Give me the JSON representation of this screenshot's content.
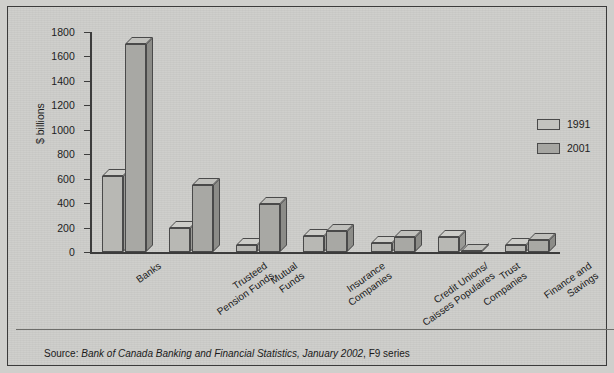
{
  "chart_data": {
    "type": "bar",
    "title": "",
    "subtitle": "",
    "xlabel": "",
    "ylabel": "$ billions",
    "ylim": [
      0,
      1800
    ],
    "ytick_step": 200,
    "yticks": [
      1800,
      1600,
      1400,
      1200,
      1000,
      800,
      600,
      400,
      200,
      0
    ],
    "grid": false,
    "legend_position": "right",
    "categories": [
      "Banks",
      "Trusteed\nPension Funds",
      "Mutual\nFunds",
      "Insurance\nCompanies",
      "Credit Unions/\nCaisses Populaires",
      "Trust\nCompanies",
      "Finance and\nSavings"
    ],
    "series": [
      {
        "name": "1991",
        "color": "#b8b8b4",
        "values": [
          620,
          200,
          60,
          130,
          70,
          125,
          55
        ]
      },
      {
        "name": "2001",
        "color": "#a8a8a4",
        "values": [
          1700,
          545,
          390,
          175,
          120,
          10,
          95
        ]
      }
    ]
  },
  "source": {
    "prefix": "Source: ",
    "emphasis": "Bank of Canada Banking and Financial Statistics, January 2002",
    "suffix": ", F9 series"
  },
  "colors": {
    "figure_background": "#cdcdca",
    "frame": "#3b3b3b",
    "axis": "#3c3c3c",
    "text": "#1d1d1d",
    "series_1991": "#b8b8b4",
    "series_2001": "#a8a8a4"
  }
}
